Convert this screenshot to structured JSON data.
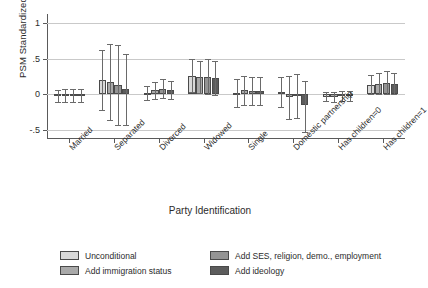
{
  "chart_data": {
    "type": "bar",
    "title": "",
    "xlabel": "Party Identification",
    "ylabel": "PSM Standardized Score",
    "ylim": [
      -0.62,
      1.12
    ],
    "yticks": [
      1,
      0.5,
      0,
      -0.5
    ],
    "ytick_labels": [
      "1",
      ".5",
      "0",
      "-.5"
    ],
    "grid": "horizontal",
    "legend_position": "bottom",
    "categories": [
      "Married",
      "Separated",
      "Divorced",
      "Widowed",
      "Single",
      "Domestic partnership",
      "Has children=0",
      "Has children=1"
    ],
    "series": [
      {
        "name": "Unconditional",
        "color": "#d9d9d9",
        "values": [
          -0.02,
          0.2,
          0.02,
          0.26,
          0.02,
          0.03,
          -0.03,
          0.13
        ],
        "ci_low": [
          -0.1,
          -0.22,
          -0.08,
          0.04,
          -0.18,
          -0.17,
          -0.09,
          0.0
        ],
        "ci_high": [
          0.06,
          0.62,
          0.12,
          0.49,
          0.22,
          0.24,
          0.03,
          0.27
        ]
      },
      {
        "name": "Add immigration status",
        "color": "#a9a9a9",
        "values": [
          -0.02,
          0.17,
          0.06,
          0.24,
          0.06,
          -0.04,
          -0.03,
          0.15
        ],
        "ci_low": [
          -0.11,
          -0.36,
          -0.06,
          0.02,
          -0.14,
          -0.34,
          -0.1,
          0.01
        ],
        "ci_high": [
          0.07,
          0.7,
          0.18,
          0.47,
          0.26,
          0.26,
          0.04,
          0.3
        ]
      },
      {
        "name": "Add SES, religion, demo., employment",
        "color": "#949494",
        "values": [
          -0.02,
          0.13,
          0.08,
          0.24,
          0.05,
          -0.02,
          -0.02,
          0.16
        ],
        "ci_low": [
          -0.11,
          -0.43,
          -0.05,
          0.0,
          -0.14,
          -0.33,
          -0.09,
          0.01
        ],
        "ci_high": [
          0.07,
          0.69,
          0.21,
          0.49,
          0.25,
          0.28,
          0.05,
          0.32
        ]
      },
      {
        "name": "Add ideology",
        "color": "#5c5c5c",
        "values": [
          -0.02,
          0.08,
          0.06,
          0.23,
          0.05,
          -0.15,
          -0.02,
          0.14
        ],
        "ci_low": [
          -0.11,
          -0.42,
          -0.06,
          -0.01,
          -0.14,
          -0.52,
          -0.09,
          0.0
        ],
        "ci_high": [
          0.07,
          0.57,
          0.19,
          0.47,
          0.25,
          0.19,
          0.05,
          0.3
        ]
      }
    ]
  },
  "legend": {
    "items": [
      {
        "label": "Unconditional",
        "color": "#d9d9d9"
      },
      {
        "label": "Add SES, religion, demo., employment",
        "color": "#949494"
      },
      {
        "label": "Add immigration status",
        "color": "#a9a9a9"
      },
      {
        "label": "Add ideology",
        "color": "#5c5c5c"
      }
    ]
  }
}
